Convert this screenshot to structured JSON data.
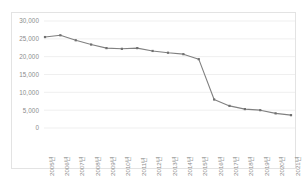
{
  "chart_data": {
    "type": "line",
    "title": "",
    "subtitle": "",
    "xlabel": "",
    "ylabel": "",
    "categories": [
      "2005년",
      "2006년",
      "2007년",
      "2008년",
      "2009년",
      "2010년",
      "2011년",
      "2012년",
      "2013년",
      "2014년",
      "2015년",
      "2016년",
      "2017년",
      "2018년",
      "2019년",
      "2020년",
      "2021년"
    ],
    "values": [
      25500,
      26000,
      24600,
      23400,
      22400,
      22200,
      22400,
      21600,
      21100,
      20700,
      19300,
      8000,
      6200,
      5300,
      5000,
      4100,
      3600
    ],
    "series": [
      {
        "name": "",
        "values": [
          25500,
          26000,
          24600,
          23400,
          22400,
          22200,
          22400,
          21600,
          21100,
          20700,
          19300,
          8000,
          6200,
          5300,
          5000,
          4100,
          3600
        ]
      }
    ],
    "ylim": [
      0,
      30000
    ],
    "ytick_values": [
      0,
      5000,
      10000,
      15000,
      20000,
      25000,
      30000
    ],
    "ytick_labels": [
      "0",
      "5,000",
      "10,000",
      "15,000",
      "20,000",
      "25,000",
      "30,000"
    ],
    "grid": true,
    "grid_axis": "y",
    "legend": false,
    "legend_position": "none",
    "marker": "square",
    "line_color": "#808080",
    "marker_color": "#707070",
    "grid_color": "#ededed",
    "border_color": "#e3e3e3",
    "background_color": "#ffffff",
    "axis_label_color": "#8c8c8c",
    "xtick_rotation": 90
  }
}
